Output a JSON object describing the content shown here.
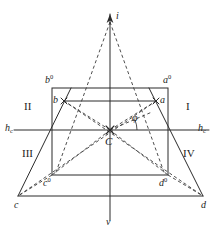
{
  "figure": {
    "colors": {
      "stroke": "#2b2b2b",
      "background": "#ffffff"
    }
  },
  "labels": {
    "apex_i": "i",
    "vertical_axis_v": "v",
    "horizon_left": "h",
    "horizon_left_sub": "c",
    "horizon_right": "h",
    "horizon_right_sub": "c",
    "center": "C",
    "angle_phi": "φ",
    "point_a": "a",
    "point_b": "b",
    "point_c": "c",
    "point_d": "d",
    "point_a0_base": "a",
    "point_a0_sup": "0",
    "point_b0_base": "b",
    "point_b0_sup": "0",
    "point_c0_base": "c",
    "point_c0_sup": "0",
    "point_d0_base": "d",
    "point_d0_sup": "0",
    "quadrant_1": "I",
    "quadrant_2": "II",
    "quadrant_3": "III",
    "quadrant_4": "IV"
  },
  "geometry": {
    "canvas": {
      "width": 223,
      "height": 236
    },
    "points": {
      "i": {
        "x": 110,
        "y": 20
      },
      "C": {
        "x": 110,
        "y": 130
      },
      "a": {
        "x": 156,
        "y": 101
      },
      "b": {
        "x": 64,
        "y": 101
      },
      "c": {
        "x": 18,
        "y": 196
      },
      "d": {
        "x": 203,
        "y": 196
      },
      "a0": {
        "x": 168,
        "y": 88
      },
      "b0": {
        "x": 52,
        "y": 88
      },
      "c0": {
        "x": 52,
        "y": 175
      },
      "d0": {
        "x": 168,
        "y": 175
      }
    },
    "axes": {
      "horizon_y": 130,
      "vertical_x": 110,
      "horizon_x_start": 14,
      "horizon_x_end": 209,
      "vertical_y_start": 14,
      "vertical_y_end": 220
    },
    "rect_left_x": 52,
    "rect_right_x": 168,
    "rect_top_y": 88,
    "rect_bottom_y": 175,
    "base_y": 196,
    "angle_phi_deg": 20
  }
}
